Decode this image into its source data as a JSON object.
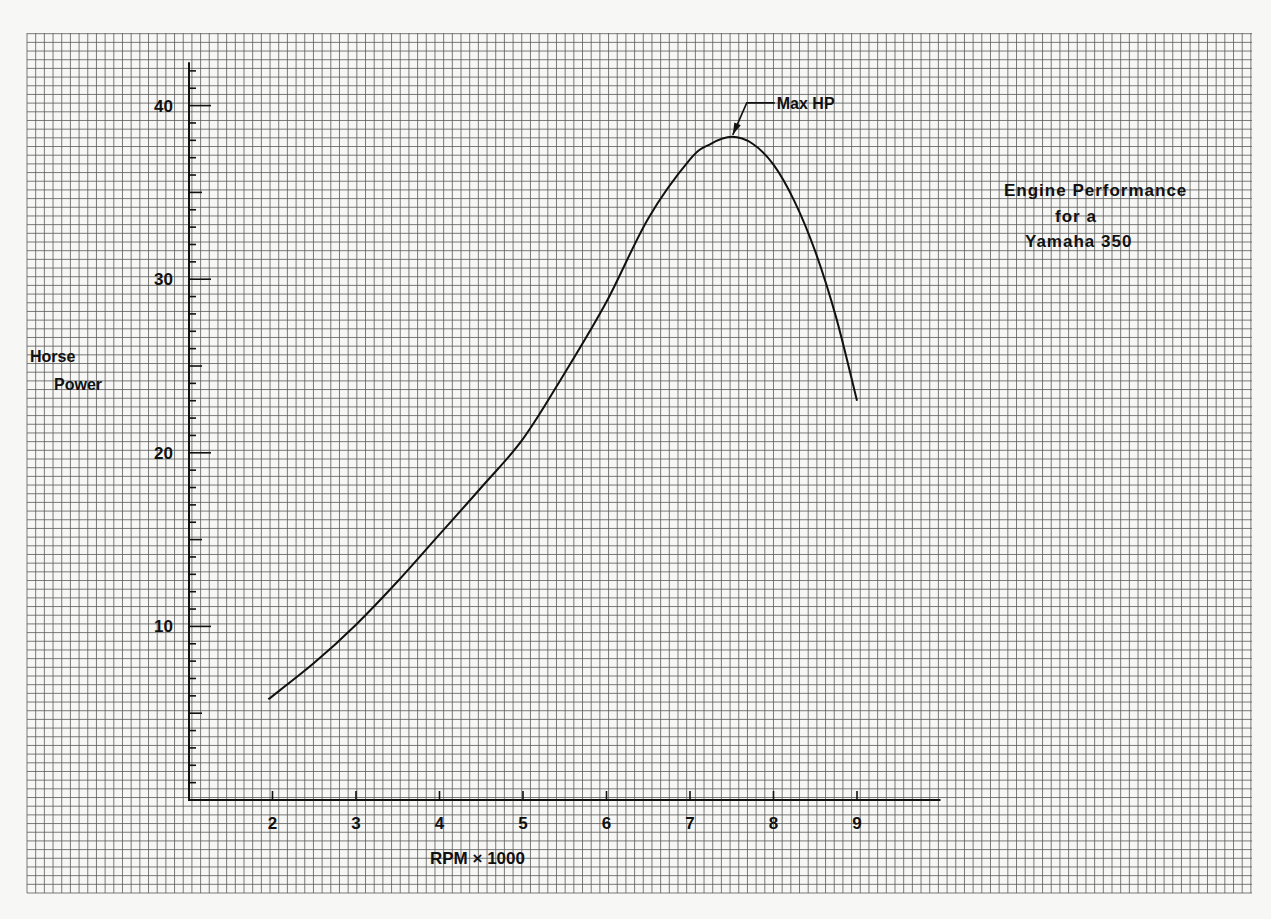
{
  "chart_data": {
    "type": "line",
    "title": [
      "Engine Performance",
      "for a",
      "Yamaha 350"
    ],
    "xlabel": "RPM × 1000",
    "ylabel": [
      "Horse",
      "Power"
    ],
    "xlim": [
      1,
      10
    ],
    "ylim": [
      0,
      42.5
    ],
    "x_ticks": [
      2,
      3,
      4,
      5,
      6,
      7,
      8,
      9
    ],
    "x_tick_labels": [
      "2",
      "3",
      "4",
      "5",
      "6",
      "7",
      "8",
      "9"
    ],
    "y_ticks": [
      10,
      20,
      30,
      40
    ],
    "y_tick_labels": [
      "10",
      "20",
      "30",
      "40"
    ],
    "y_minor_step": 1,
    "grid": true,
    "legend": "none",
    "series": [
      {
        "name": "Horse Power",
        "x": [
          1.95,
          2.5,
          3.0,
          3.5,
          4.0,
          4.5,
          5.0,
          5.5,
          6.0,
          6.5,
          7.0,
          7.25,
          7.5,
          7.75,
          8.0,
          8.25,
          8.5,
          8.75,
          9.0
        ],
        "y": [
          5.8,
          7.9,
          10.1,
          12.6,
          15.3,
          18.0,
          20.8,
          24.6,
          28.7,
          33.5,
          36.9,
          37.8,
          38.2,
          37.8,
          36.6,
          34.5,
          31.6,
          27.8,
          23.0
        ]
      }
    ],
    "annotations": [
      {
        "text": "Max HP",
        "x": 7.5,
        "y": 38.2
      }
    ]
  }
}
